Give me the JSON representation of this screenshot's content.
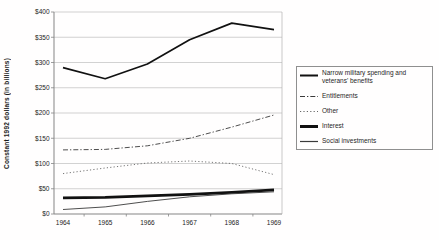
{
  "chart_data": {
    "type": "line",
    "title": "",
    "ylabel": "Constant 1992 dollars (in billions)",
    "xlabel": "",
    "categories": [
      "1964",
      "1965",
      "1966",
      "1967",
      "1968",
      "1969"
    ],
    "y_ticks": [
      "$0",
      "$50",
      "$100",
      "$150",
      "$200",
      "$250",
      "$300",
      "$350",
      "$400"
    ],
    "ylim": [
      0,
      400
    ],
    "grid": "horizontal",
    "legend_position": "right",
    "series": [
      {
        "name": "Narrow military spending and veterans' benefits",
        "style": "solid-medium",
        "values": [
          290,
          268,
          297,
          345,
          378,
          365
        ]
      },
      {
        "name": "Entitlements",
        "style": "dash-dot",
        "values": [
          127,
          128,
          135,
          150,
          172,
          196
        ]
      },
      {
        "name": "Other",
        "style": "dotted",
        "values": [
          80,
          91,
          101,
          105,
          100,
          78
        ]
      },
      {
        "name": "Interest",
        "style": "solid-thick",
        "values": [
          32,
          33,
          36,
          39,
          43,
          48
        ]
      },
      {
        "name": "Social investments",
        "style": "solid-thin",
        "values": [
          9,
          14,
          25,
          34,
          40,
          44
        ]
      }
    ],
    "colors": {
      "background": "#fffefe",
      "gridline": "#b3b3b3",
      "axis": "#858585",
      "line_dark": "#111111",
      "line_mid": "#3a3a3a",
      "line_light": "#666666",
      "legend_border": "#8f8f8f"
    }
  }
}
